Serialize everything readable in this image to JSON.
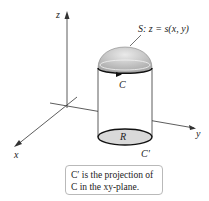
{
  "figure": {
    "surface_label": "S: z = s(x, y)",
    "curve_label": "C",
    "region_label": "R",
    "projection_label": "C′",
    "axes": {
      "x": "x",
      "y": "y",
      "z": "z"
    },
    "caption_line1": "C′ is the projection of",
    "caption_line2": "C in the xy-plane.",
    "colors": {
      "dome": "#c8c8c8",
      "region": "#d9d9d9",
      "line": "#222222",
      "caption_border": "#b9b9b9"
    }
  }
}
